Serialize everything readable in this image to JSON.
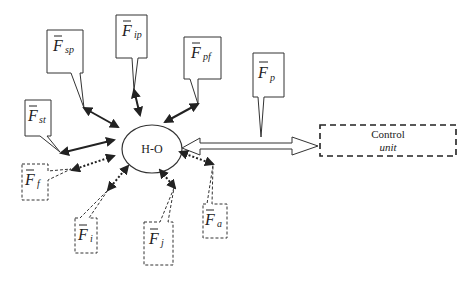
{
  "diagram": {
    "center_node": {
      "label": "H-O"
    },
    "control_unit": {
      "title": "Control",
      "subtitle": "unit"
    },
    "connection": {
      "label_symbol": "F",
      "label_sub": "p"
    },
    "solid_factors": [
      {
        "id": "sp",
        "symbol": "F",
        "sub": "sp"
      },
      {
        "id": "ip",
        "symbol": "F",
        "sub": "ip"
      },
      {
        "id": "pf",
        "symbol": "F",
        "sub": "pf"
      },
      {
        "id": "st",
        "symbol": "F",
        "sub": "st"
      }
    ],
    "dashed_factors": [
      {
        "id": "f",
        "symbol": "F",
        "sub": "f"
      },
      {
        "id": "i",
        "symbol": "F",
        "sub": "i"
      },
      {
        "id": "j",
        "symbol": "F",
        "sub": "j"
      },
      {
        "id": "a",
        "symbol": "F",
        "sub": "a"
      }
    ],
    "colors": {
      "line": "#222222",
      "background": "#ffffff"
    }
  }
}
